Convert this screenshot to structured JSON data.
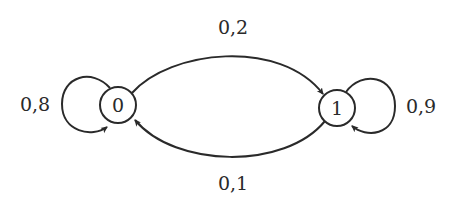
{
  "diagram": {
    "type": "markov-chain",
    "states": [
      {
        "id": "s0",
        "label": "0"
      },
      {
        "id": "s1",
        "label": "1"
      }
    ],
    "transitions": [
      {
        "from": "0",
        "to": "0",
        "label": "0,8"
      },
      {
        "from": "0",
        "to": "1",
        "label": "0,2"
      },
      {
        "from": "1",
        "to": "0",
        "label": "0,1"
      },
      {
        "from": "1",
        "to": "1",
        "label": "0,9"
      }
    ],
    "colors": {
      "stroke": "#2a2a2a",
      "background": "#ffffff"
    }
  }
}
